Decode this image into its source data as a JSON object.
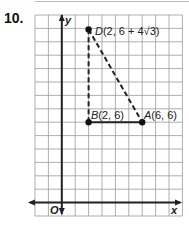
{
  "problem": {
    "number": "10."
  },
  "graph": {
    "grid": {
      "columns": 11,
      "rows": 15,
      "origin_col": 2,
      "origin_row": 14,
      "line_color": "#9a9a9a",
      "axis_color": "#222222"
    },
    "axes": {
      "x_label": "x",
      "y_label": "y",
      "origin_label": "O"
    },
    "points": [
      {
        "name": "D",
        "x": 2,
        "y": 12.928,
        "label_name": "D",
        "label_coords": "(2, 6 + 4√3)"
      },
      {
        "name": "B",
        "x": 2,
        "y": 6,
        "label_name": "B",
        "label_coords": "(2, 6)"
      },
      {
        "name": "A",
        "x": 6,
        "y": 6,
        "label_name": "A",
        "label_coords": "(6, 6)"
      }
    ],
    "segments": [
      {
        "from": "B",
        "to": "A",
        "style": "solid"
      },
      {
        "from": "B",
        "to": "D",
        "style": "dashed"
      },
      {
        "from": "D",
        "to": "A",
        "style": "dashed"
      }
    ]
  },
  "chart_data": {
    "type": "scatter",
    "title": "",
    "xlabel": "x",
    "ylabel": "y",
    "xlim": [
      -2,
      9
    ],
    "ylim": [
      -1,
      14
    ],
    "grid": true,
    "points": [
      {
        "label": "D(2, 6 + 4√3)",
        "x": 2,
        "y": 12.928
      },
      {
        "label": "B(2, 6)",
        "x": 2,
        "y": 6
      },
      {
        "label": "A(6, 6)",
        "x": 6,
        "y": 6
      }
    ],
    "segments": [
      {
        "from": [
          2,
          6
        ],
        "to": [
          6,
          6
        ],
        "style": "solid"
      },
      {
        "from": [
          2,
          6
        ],
        "to": [
          2,
          12.928
        ],
        "style": "dashed"
      },
      {
        "from": [
          2,
          12.928
        ],
        "to": [
          6,
          6
        ],
        "style": "dashed"
      }
    ]
  }
}
